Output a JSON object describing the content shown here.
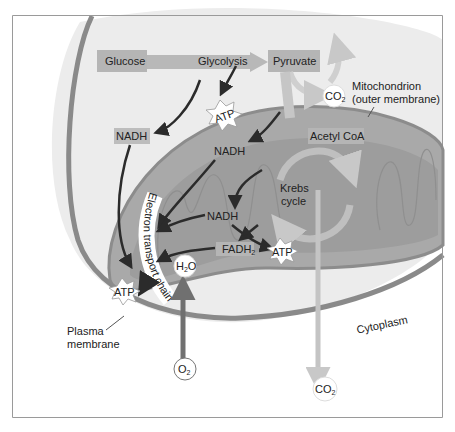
{
  "diagram": {
    "boxes": {
      "glucose": "Glucose",
      "glycolysis": "Glycolysis",
      "pyruvate": "Pyruvate",
      "acetyl_coa": "Acetyl CoA",
      "nadh_1": "NADH",
      "nadh_2": "NADH",
      "nadh_3": "NADH",
      "fadh2": "FADH",
      "fadh2_sub": "2",
      "krebs_line1": "Krebs",
      "krebs_line2": "cycle",
      "etc": "Electron transport chain"
    },
    "molecules": {
      "atp_1": "ATP",
      "atp_2": "ATP",
      "atp_3": "ATP",
      "co2_top": "CO",
      "co2_top_sub": "2",
      "co2_bottom": "CO",
      "co2_bottom_sub": "2",
      "h2o_h": "H",
      "h2o_sub": "2",
      "h2o_o": "O",
      "o2": "O",
      "o2_sub": "2"
    },
    "labels": {
      "mito_line1": "Mitochondrion",
      "mito_line2": "(outer membrane)",
      "plasma_line1": "Plasma",
      "plasma_line2": "membrane",
      "cytoplasm": "Cytoplasm"
    },
    "colors": {
      "cell_fill": "#ececec",
      "membrane": "#8a8a8a",
      "mito_fill": "#a9a9a9",
      "mito_inner": "#9d9d9d",
      "box_fill": "#b5b5b5",
      "arrow_dark": "#2b2b2b",
      "arrow_light": "#c8c8c8"
    }
  }
}
